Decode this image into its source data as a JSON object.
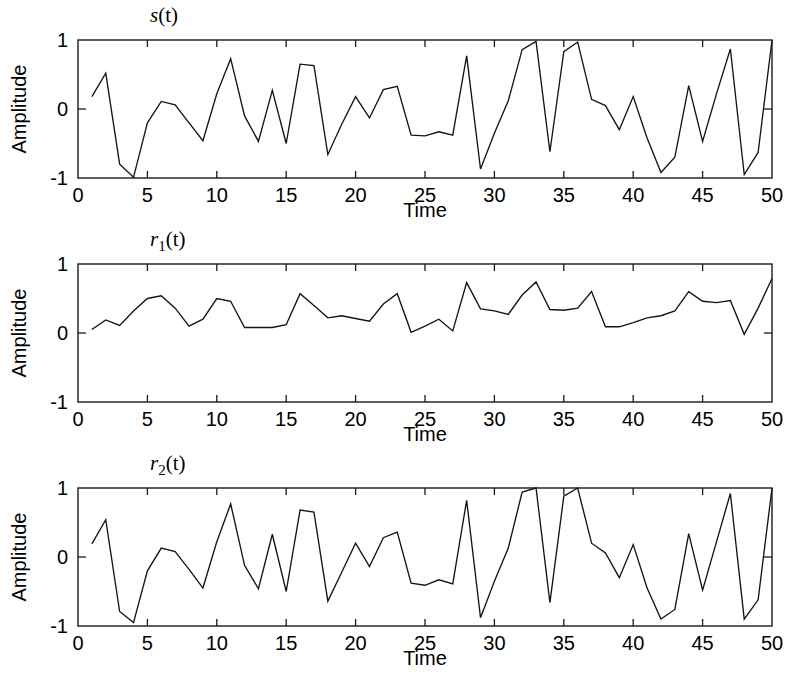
{
  "figure": {
    "background": "#ffffff",
    "line_color": "#141414",
    "axis_color": "#1a1a1a"
  },
  "chart_data": [
    {
      "type": "line",
      "title": "s(t)",
      "title_base": "s",
      "title_sub": "",
      "title_tail": "(t)",
      "xlabel": "Time",
      "ylabel": "Amplitude",
      "xlim": [
        0,
        50
      ],
      "ylim": [
        -1,
        1
      ],
      "xticks": [
        0,
        5,
        10,
        15,
        20,
        25,
        30,
        35,
        40,
        45,
        50
      ],
      "xticklabels": [
        "0",
        "5",
        "10",
        "15",
        "20",
        "25",
        "30",
        "35",
        "40",
        "45",
        "50"
      ],
      "yticks": [
        -1,
        0,
        1
      ],
      "yticklabels": [
        "-1",
        "0",
        "1"
      ],
      "grid": false,
      "legend": "none",
      "x": [
        1,
        2,
        3,
        4,
        5,
        6,
        7,
        8,
        9,
        10,
        11,
        12,
        13,
        14,
        15,
        16,
        17,
        18,
        19,
        20,
        21,
        22,
        23,
        24,
        25,
        26,
        27,
        28,
        29,
        30,
        31,
        32,
        33,
        34,
        35,
        36,
        37,
        38,
        39,
        40,
        41,
        42,
        43,
        44,
        45,
        46,
        47,
        48,
        49,
        50
      ],
      "values": [
        0.18,
        0.52,
        -0.8,
        -0.99,
        -0.2,
        0.11,
        0.06,
        -0.2,
        -0.46,
        0.22,
        0.73,
        -0.1,
        -0.47,
        0.27,
        -0.5,
        0.65,
        0.63,
        -0.66,
        -0.22,
        0.18,
        -0.13,
        0.28,
        0.33,
        -0.38,
        -0.39,
        -0.33,
        -0.38,
        0.77,
        -0.87,
        -0.35,
        0.12,
        0.86,
        0.98,
        -0.62,
        0.83,
        0.97,
        0.14,
        0.05,
        -0.3,
        0.18,
        -0.42,
        -0.92,
        -0.7,
        0.34,
        -0.47,
        0.22,
        0.87,
        -0.95,
        -0.63,
        1.0
      ]
    },
    {
      "type": "line",
      "title": "r1(t)",
      "title_base": "r",
      "title_sub": "1",
      "title_tail": "(t)",
      "xlabel": "Time",
      "ylabel": "Amplitude",
      "xlim": [
        0,
        50
      ],
      "ylim": [
        -1,
        1
      ],
      "xticks": [
        0,
        5,
        10,
        15,
        20,
        25,
        30,
        35,
        40,
        45,
        50
      ],
      "xticklabels": [
        "0",
        "5",
        "10",
        "15",
        "20",
        "25",
        "30",
        "35",
        "40",
        "45",
        "50"
      ],
      "yticks": [
        -1,
        0,
        1
      ],
      "yticklabels": [
        "-1",
        "0",
        "1"
      ],
      "grid": false,
      "legend": "none",
      "x": [
        1,
        2,
        3,
        4,
        5,
        6,
        7,
        8,
        9,
        10,
        11,
        12,
        13,
        14,
        15,
        16,
        17,
        18,
        19,
        20,
        21,
        22,
        23,
        24,
        25,
        26,
        27,
        28,
        29,
        30,
        31,
        32,
        33,
        34,
        35,
        36,
        37,
        38,
        39,
        40,
        41,
        42,
        43,
        44,
        45,
        46,
        47,
        48,
        49,
        50
      ],
      "values": [
        0.05,
        0.19,
        0.11,
        0.32,
        0.5,
        0.54,
        0.36,
        0.1,
        0.2,
        0.5,
        0.46,
        0.08,
        0.08,
        0.08,
        0.12,
        0.57,
        0.4,
        0.22,
        0.25,
        0.21,
        0.17,
        0.42,
        0.57,
        0.01,
        0.1,
        0.2,
        0.03,
        0.73,
        0.35,
        0.32,
        0.27,
        0.55,
        0.74,
        0.34,
        0.33,
        0.36,
        0.6,
        0.09,
        0.09,
        0.15,
        0.22,
        0.25,
        0.32,
        0.6,
        0.46,
        0.44,
        0.47,
        -0.02,
        0.36,
        0.79
      ]
    },
    {
      "type": "line",
      "title": "r2(t)",
      "title_base": "r",
      "title_sub": "2",
      "title_tail": "(t)",
      "xlabel": "Time",
      "ylabel": "Amplitude",
      "xlim": [
        0,
        50
      ],
      "ylim": [
        -1,
        1
      ],
      "xticks": [
        0,
        5,
        10,
        15,
        20,
        25,
        30,
        35,
        40,
        45,
        50
      ],
      "xticklabels": [
        "0",
        "5",
        "10",
        "15",
        "20",
        "25",
        "30",
        "35",
        "40",
        "45",
        "50"
      ],
      "yticks": [
        -1,
        0,
        1
      ],
      "yticklabels": [
        "-1",
        "0",
        "1"
      ],
      "grid": false,
      "legend": "none",
      "x": [
        1,
        2,
        3,
        4,
        5,
        6,
        7,
        8,
        9,
        10,
        11,
        12,
        13,
        14,
        15,
        16,
        17,
        18,
        19,
        20,
        21,
        22,
        23,
        24,
        25,
        26,
        27,
        28,
        29,
        30,
        31,
        32,
        33,
        34,
        35,
        36,
        37,
        38,
        39,
        40,
        41,
        42,
        43,
        44,
        45,
        46,
        47,
        48,
        49,
        50
      ],
      "values": [
        0.19,
        0.54,
        -0.79,
        -0.95,
        -0.2,
        0.13,
        0.08,
        -0.18,
        -0.45,
        0.22,
        0.77,
        -0.12,
        -0.46,
        0.33,
        -0.5,
        0.68,
        0.65,
        -0.64,
        -0.22,
        0.2,
        -0.14,
        0.28,
        0.36,
        -0.38,
        -0.41,
        -0.33,
        -0.39,
        0.82,
        -0.88,
        -0.35,
        0.13,
        0.94,
        1.0,
        -0.66,
        0.88,
        1.0,
        0.2,
        0.06,
        -0.3,
        0.18,
        -0.45,
        -0.9,
        -0.76,
        0.34,
        -0.48,
        0.22,
        0.92,
        -0.9,
        -0.62,
        1.0
      ]
    }
  ]
}
